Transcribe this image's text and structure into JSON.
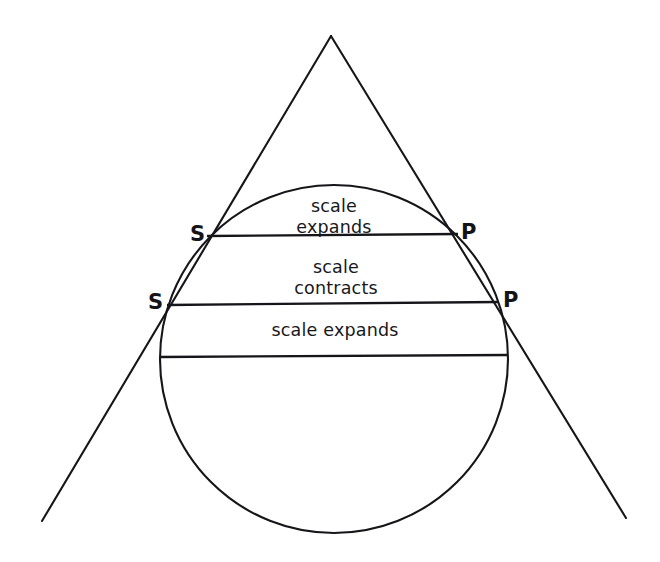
{
  "figure": {
    "name": "tangent-circle-scale-diagram",
    "background_color": "#ffffff",
    "ink_color": "#16161a",
    "width": 660,
    "height": 562
  },
  "labels": {
    "s_upper": "S",
    "s_lower": "S",
    "p_upper": "P",
    "p_lower": "P"
  },
  "bands": [
    {
      "id": "band-top",
      "text": "scale\nexpands",
      "cx": 334,
      "cy": 196
    },
    {
      "id": "band-middle",
      "text": "scale\ncontracts",
      "cx": 336,
      "cy": 257
    },
    {
      "id": "band-bottom",
      "text": "scale  expands",
      "cx": 335,
      "cy": 320
    }
  ],
  "geometry": {
    "circle": {
      "cx": 334,
      "cy": 359,
      "r": 174
    },
    "apex": {
      "x": 331,
      "y": 36
    },
    "left_ray_end": {
      "x": 42,
      "y": 521
    },
    "right_ray_end": {
      "x": 626,
      "y": 518
    },
    "chords": [
      {
        "id": "chord-sp-upper",
        "x1": 207,
        "y1": 236,
        "x2": 458,
        "y2": 234
      },
      {
        "id": "chord-sp-lower",
        "x1": 167,
        "y1": 305,
        "x2": 498,
        "y2": 302
      },
      {
        "id": "chord-equator",
        "x1": 160,
        "y1": 357,
        "x2": 508,
        "y2": 355
      }
    ]
  }
}
